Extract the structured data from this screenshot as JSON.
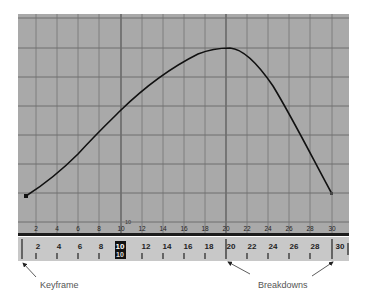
{
  "graph_editor": {
    "background_color": "#a9a9a9",
    "grid_color": "#7e7e7e",
    "major_grid_color": "#5a5a5a",
    "curve_color": "#111111",
    "frame_labels": [
      "2",
      "4",
      "6",
      "8",
      "10",
      "12",
      "14",
      "16",
      "18",
      "20",
      "22",
      "24",
      "26",
      "28",
      "30"
    ],
    "current_frame_value_label": "10",
    "curve": {
      "start_frame": 1.2,
      "peak_frame": 20,
      "end_frame": 30
    }
  },
  "time_slider": {
    "background_color": "#c8c8c8",
    "frame_labels": [
      "2",
      "4",
      "6",
      "8",
      "10",
      "12",
      "14",
      "16",
      "18",
      "20",
      "22",
      "24",
      "26",
      "28",
      "30"
    ],
    "current_frame": "10",
    "keyframe_marks": [
      "1",
      "20",
      "30"
    ]
  },
  "annotations": {
    "keyframe": "Keyframe",
    "breakdowns": "Breakdowns"
  }
}
